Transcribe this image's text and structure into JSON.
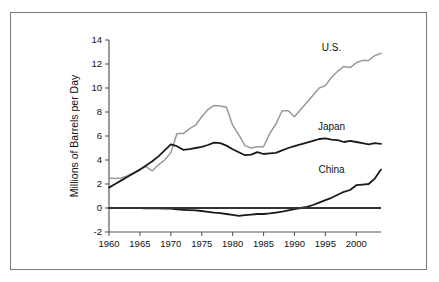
{
  "chart_data": {
    "type": "line",
    "title": "",
    "xlabel": "",
    "ylabel": "Millions of Barrels per Day",
    "xlim": [
      1960,
      2004
    ],
    "ylim": [
      -2,
      14
    ],
    "yticks": [
      -2,
      0,
      2,
      4,
      6,
      8,
      10,
      12,
      14
    ],
    "xticks": [
      1960,
      1965,
      1970,
      1975,
      1980,
      1985,
      1990,
      1995,
      2000
    ],
    "ytick_labels": [
      "-2",
      "0",
      "2",
      "4",
      "6",
      "8",
      "10",
      "12",
      "14"
    ],
    "xtick_labels": [
      "1960",
      "1965",
      "1970",
      "1975",
      "1980",
      "1985",
      "1990",
      "1995",
      "2000"
    ],
    "grid": false,
    "legend_position": "inline-annotations",
    "zero_line": true,
    "x": [
      1960,
      1961,
      1962,
      1963,
      1964,
      1965,
      1966,
      1967,
      1968,
      1969,
      1970,
      1971,
      1972,
      1973,
      1974,
      1975,
      1976,
      1977,
      1978,
      1979,
      1980,
      1981,
      1982,
      1983,
      1984,
      1985,
      1986,
      1987,
      1988,
      1989,
      1990,
      1991,
      1992,
      1993,
      1994,
      1995,
      1996,
      1997,
      1998,
      1999,
      2000,
      2001,
      2002,
      2003,
      2004
    ],
    "series": [
      {
        "name": "U.S.",
        "color": "#999999",
        "label_year": 1996,
        "label_value": 13.1,
        "values": [
          2.5,
          2.45,
          2.5,
          2.7,
          2.95,
          3.2,
          3.45,
          3.1,
          3.6,
          4.0,
          4.6,
          6.2,
          6.2,
          6.6,
          6.9,
          7.6,
          8.2,
          8.55,
          8.5,
          8.4,
          6.9,
          6.1,
          5.2,
          5.0,
          5.1,
          5.1,
          6.2,
          7.0,
          8.1,
          8.1,
          7.6,
          8.2,
          8.8,
          9.4,
          10.0,
          10.2,
          10.9,
          11.4,
          11.8,
          11.7,
          12.1,
          12.3,
          12.3,
          12.7,
          12.9
        ]
      },
      {
        "name": "Japan",
        "color": "#1a1a1a",
        "label_year": 1996,
        "label_value": 6.5,
        "values": [
          1.7,
          2.0,
          2.3,
          2.6,
          2.9,
          3.2,
          3.55,
          3.9,
          4.3,
          4.8,
          5.3,
          5.15,
          4.85,
          4.9,
          5.0,
          5.1,
          5.25,
          5.45,
          5.4,
          5.2,
          4.9,
          4.65,
          4.4,
          4.45,
          4.65,
          4.5,
          4.55,
          4.6,
          4.8,
          5.0,
          5.15,
          5.3,
          5.45,
          5.6,
          5.75,
          5.8,
          5.7,
          5.65,
          5.5,
          5.6,
          5.5,
          5.4,
          5.3,
          5.4,
          5.35
        ]
      },
      {
        "name": "China",
        "color": "#1a1a1a",
        "label_year": 1996,
        "label_value": 2.9,
        "values": [
          0.0,
          0.0,
          0.0,
          0.0,
          0.0,
          0.0,
          -0.02,
          -0.03,
          -0.03,
          -0.04,
          -0.05,
          -0.12,
          -0.15,
          -0.18,
          -0.2,
          -0.25,
          -0.32,
          -0.38,
          -0.42,
          -0.5,
          -0.58,
          -0.65,
          -0.6,
          -0.55,
          -0.5,
          -0.5,
          -0.45,
          -0.38,
          -0.3,
          -0.2,
          -0.1,
          0.0,
          0.1,
          0.25,
          0.45,
          0.65,
          0.85,
          1.1,
          1.35,
          1.5,
          1.9,
          1.95,
          2.0,
          2.45,
          3.2
        ]
      }
    ],
    "annotations": [
      {
        "text": "U.S."
      },
      {
        "text": "Japan"
      },
      {
        "text": "China"
      }
    ]
  },
  "figure": {
    "border_color": "#7a7a7a",
    "background": "#ffffff"
  }
}
